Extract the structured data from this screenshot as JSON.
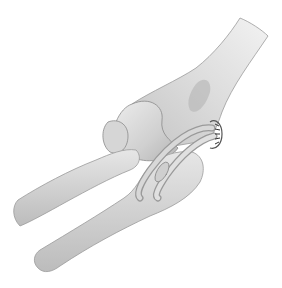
{
  "figure": {
    "style": "grayscale medical illustration",
    "colors": {
      "background": "#ffffff",
      "bone_light": "#e4e4e4",
      "bone_mid": "#c8c8c8",
      "bone_shadow": "#9a9a9a",
      "outline": "#8a8a8a",
      "suture": "#3a3a3a"
    },
    "structures": [
      "humerus",
      "radius",
      "ulna",
      "tendon-graft-loop",
      "suture-anchor"
    ]
  }
}
